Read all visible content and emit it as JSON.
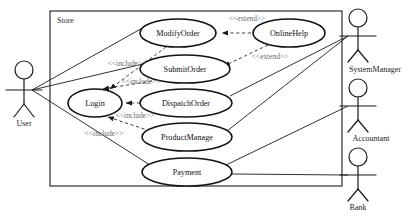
{
  "diagram": {
    "type": "uml-use-case-diagram",
    "boundary": {
      "label": "Store",
      "x": 50,
      "y": 11,
      "width": 292,
      "height": 175
    },
    "use_cases": [
      {
        "id": "modify-order",
        "label": "ModifyOrder",
        "cx": 178,
        "cy": 33,
        "rx": 38,
        "ry": 14
      },
      {
        "id": "online-help",
        "label": "OnlineHelp",
        "cx": 289,
        "cy": 33,
        "rx": 36,
        "ry": 14
      },
      {
        "id": "submit-order",
        "label": "SubmitOrder",
        "cx": 185,
        "cy": 69,
        "rx": 45,
        "ry": 14
      },
      {
        "id": "login",
        "label": "Login",
        "cx": 95,
        "cy": 103,
        "rx": 27,
        "ry": 14
      },
      {
        "id": "dispatch-order",
        "label": "DispatchOrder",
        "cx": 186,
        "cy": 103,
        "rx": 46,
        "ry": 14
      },
      {
        "id": "product-manage",
        "label": "ProductManage",
        "cx": 187,
        "cy": 137,
        "rx": 45,
        "ry": 14
      },
      {
        "id": "payment",
        "label": "Payment",
        "cx": 187,
        "cy": 172,
        "rx": 45,
        "ry": 14
      }
    ],
    "actors": [
      {
        "id": "user",
        "label": "User",
        "x": 24,
        "y": 70,
        "label_y": 124
      },
      {
        "id": "system-manager",
        "label": "SystemManager",
        "x": 358,
        "y": 18,
        "label_y": 70
      },
      {
        "id": "accountant",
        "label": "Accountant",
        "x": 358,
        "y": 88,
        "label_y": 139
      },
      {
        "id": "bank",
        "label": "Bank",
        "x": 358,
        "y": 157,
        "label_y": 207
      }
    ],
    "associations": [
      {
        "from": "user",
        "to": "modify-order"
      },
      {
        "from": "user",
        "to": "submit-order"
      },
      {
        "from": "user",
        "to": "payment"
      },
      {
        "from": "system-manager",
        "to": "dispatch-order"
      },
      {
        "from": "system-manager",
        "to": "product-manage"
      },
      {
        "from": "accountant",
        "to": "payment"
      },
      {
        "from": "bank",
        "to": "payment"
      }
    ],
    "dependencies": [
      {
        "from": "online-help",
        "to": "modify-order",
        "stereotype": "<<extend>>",
        "label_x": 247,
        "label_y": 21
      },
      {
        "from": "online-help",
        "to": "submit-order",
        "stereotype": "<<extend>>",
        "label_x": 270,
        "label_y": 59
      },
      {
        "from": "modify-order",
        "to": "login",
        "stereotype": "<<include>>",
        "label_x": 127,
        "label_y": 66
      },
      {
        "from": "submit-order",
        "to": "login",
        "stereotype": "<<include>>",
        "label_x": 141,
        "label_y": 84
      },
      {
        "from": "dispatch-order",
        "to": "login",
        "stereotype": "<<include>>",
        "label_x": 135,
        "label_y": 118
      },
      {
        "from": "product-manage",
        "to": "login",
        "stereotype": "<<include>>",
        "label_x": 104,
        "label_y": 136
      }
    ]
  }
}
